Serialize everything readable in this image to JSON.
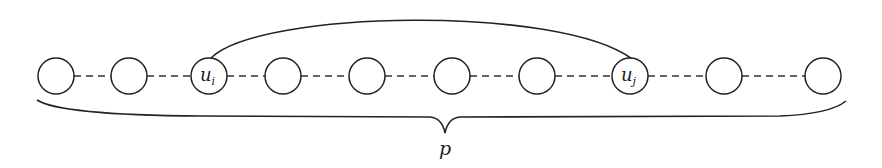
{
  "diagram": {
    "nodes": [
      {
        "id": "n1",
        "label": "",
        "sub": "",
        "x": 56
      },
      {
        "id": "n2",
        "label": "",
        "sub": "",
        "x": 129
      },
      {
        "id": "ui",
        "label": "u",
        "sub": "i",
        "x": 209
      },
      {
        "id": "n4",
        "label": "",
        "sub": "",
        "x": 283
      },
      {
        "id": "n5",
        "label": "",
        "sub": "",
        "x": 367
      },
      {
        "id": "n6",
        "label": "",
        "sub": "",
        "x": 452
      },
      {
        "id": "n7",
        "label": "",
        "sub": "",
        "x": 537
      },
      {
        "id": "uj",
        "label": "u",
        "sub": "j",
        "x": 630
      },
      {
        "id": "n9",
        "label": "",
        "sub": "",
        "x": 724
      },
      {
        "id": "n10",
        "label": "",
        "sub": "",
        "x": 823
      }
    ],
    "node_y": 76,
    "node_r": 18,
    "edge_style": "dashed",
    "arc": {
      "from": "ui",
      "to": "uj"
    },
    "brace_label": "p",
    "stroke_color": "#222222"
  }
}
